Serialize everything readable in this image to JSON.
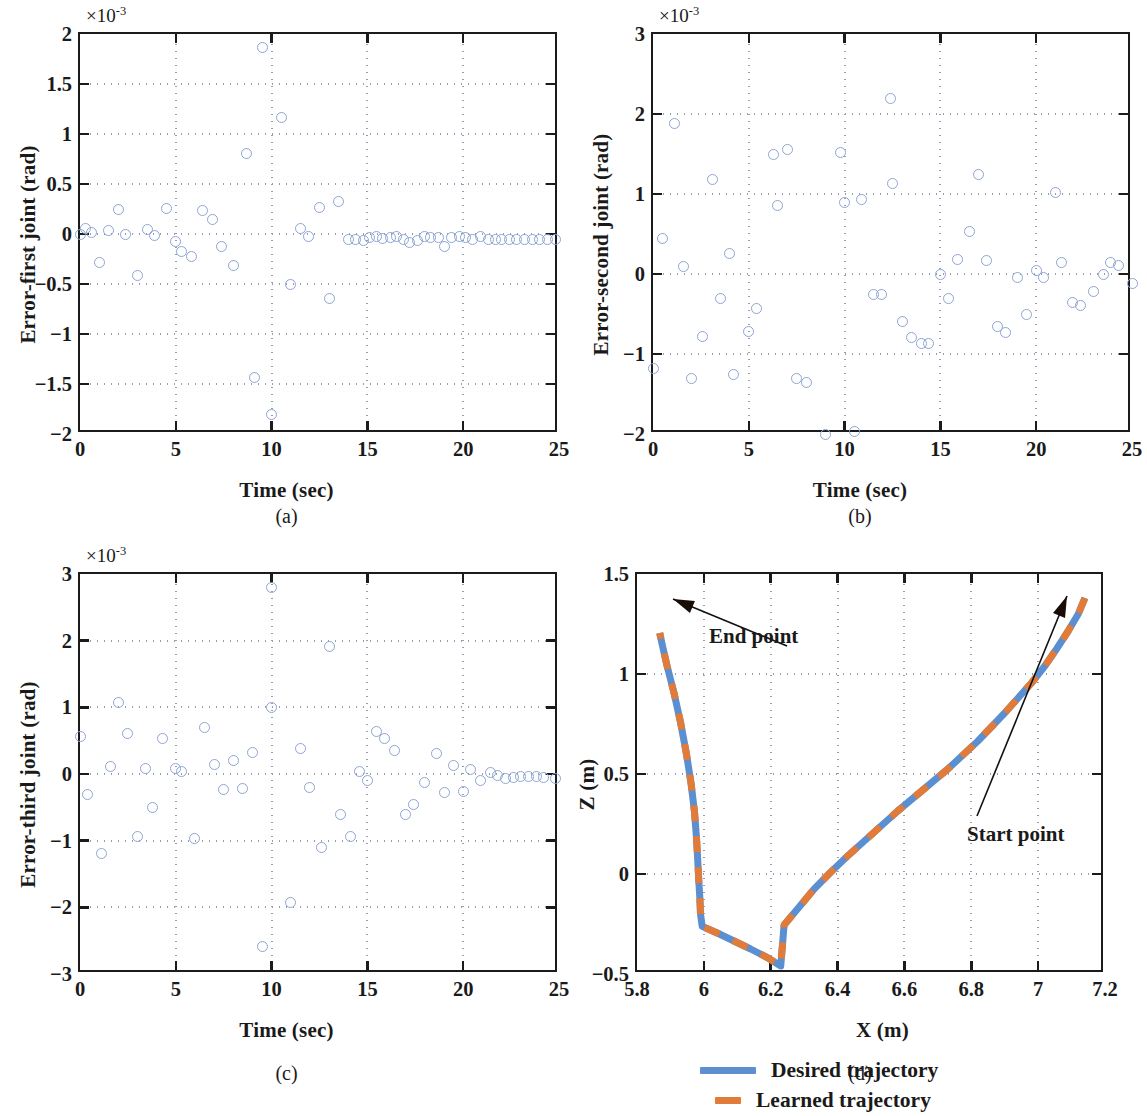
{
  "figure": {
    "panels": [
      {
        "id": "a",
        "caption": "(a)"
      },
      {
        "id": "b",
        "caption": "(b)"
      },
      {
        "id": "c",
        "caption": "(c)"
      },
      {
        "id": "d",
        "caption": "(d)"
      }
    ],
    "marker_color": "#8da5d4",
    "desired_color": "#5b8fd0",
    "learned_color": "#e07b39",
    "axis_color": "#1b1b1b",
    "grid_color": "#9a9ab0"
  },
  "legend": {
    "desired_label": "Desired trajectory",
    "learned_label": "Learned trajectory"
  },
  "chart_data": [
    {
      "type": "scatter",
      "panel": "a",
      "title": "",
      "xlabel": "Time (sec)",
      "ylabel": "Error-first joint (rad)",
      "y_exponent": "×10",
      "y_exponent_power": "-3",
      "xlim": [
        0,
        25
      ],
      "ylim": [
        -2,
        2
      ],
      "xticks": [
        0,
        5,
        10,
        15,
        20,
        25
      ],
      "xtick_labels": [
        "0",
        "5",
        "10",
        "15",
        "20",
        "25"
      ],
      "yticks": [
        -2,
        -1.5,
        -1,
        -0.5,
        0,
        0.5,
        1,
        1.5,
        2
      ],
      "ytick_labels": [
        "−2",
        "−1.5",
        "−1",
        "−0.5",
        "0",
        "0.5",
        "1",
        "1.5",
        "2"
      ],
      "grid": true,
      "legend_position": "none",
      "points": [
        [
          0.0,
          0.0
        ],
        [
          0.3,
          0.06
        ],
        [
          0.6,
          0.02
        ],
        [
          1.0,
          -0.28
        ],
        [
          1.5,
          0.04
        ],
        [
          2.0,
          0.25
        ],
        [
          2.4,
          0.0
        ],
        [
          3.0,
          -0.41
        ],
        [
          3.5,
          0.05
        ],
        [
          3.9,
          -0.01
        ],
        [
          4.5,
          0.26
        ],
        [
          5.0,
          -0.07
        ],
        [
          5.3,
          -0.17
        ],
        [
          5.8,
          -0.22
        ],
        [
          6.4,
          0.24
        ],
        [
          6.9,
          0.15
        ],
        [
          7.4,
          -0.12
        ],
        [
          8.0,
          -0.31
        ],
        [
          8.7,
          0.81
        ],
        [
          9.1,
          -1.43
        ],
        [
          9.5,
          1.87
        ],
        [
          10.0,
          -1.8
        ],
        [
          10.5,
          1.17
        ],
        [
          11.0,
          -0.5
        ],
        [
          11.5,
          0.06
        ],
        [
          11.9,
          -0.02
        ],
        [
          12.5,
          0.27
        ],
        [
          13.0,
          -0.64
        ],
        [
          13.5,
          0.33
        ],
        [
          14.0,
          -0.05
        ],
        [
          14.4,
          -0.05
        ],
        [
          14.8,
          -0.06
        ],
        [
          15.1,
          -0.03
        ],
        [
          15.5,
          -0.02
        ],
        [
          15.8,
          -0.04
        ],
        [
          16.2,
          -0.03
        ],
        [
          16.5,
          -0.02
        ],
        [
          16.9,
          -0.05
        ],
        [
          17.2,
          -0.08
        ],
        [
          17.6,
          -0.06
        ],
        [
          18.0,
          -0.02
        ],
        [
          18.3,
          -0.03
        ],
        [
          18.7,
          -0.03
        ],
        [
          19.0,
          -0.12
        ],
        [
          19.4,
          -0.03
        ],
        [
          19.8,
          -0.02
        ],
        [
          20.1,
          -0.03
        ],
        [
          20.5,
          -0.05
        ],
        [
          20.9,
          -0.02
        ],
        [
          21.3,
          -0.05
        ],
        [
          21.7,
          -0.05
        ],
        [
          22.0,
          -0.05
        ],
        [
          22.4,
          -0.05
        ],
        [
          22.8,
          -0.05
        ],
        [
          23.2,
          -0.05
        ],
        [
          23.6,
          -0.05
        ],
        [
          24.0,
          -0.05
        ],
        [
          24.4,
          -0.05
        ],
        [
          24.8,
          -0.05
        ]
      ]
    },
    {
      "type": "scatter",
      "panel": "b",
      "title": "",
      "xlabel": "Time (sec)",
      "ylabel": "Error-second joint (rad)",
      "y_exponent": "×10",
      "y_exponent_power": "-3",
      "xlim": [
        0,
        25
      ],
      "ylim": [
        -2,
        3
      ],
      "xticks": [
        0,
        5,
        10,
        15,
        20,
        25
      ],
      "xtick_labels": [
        "0",
        "5",
        "10",
        "15",
        "20",
        "25"
      ],
      "yticks": [
        -2,
        -1,
        0,
        1,
        2,
        3
      ],
      "ytick_labels": [
        "−2",
        "−1",
        "0",
        "1",
        "2",
        "3"
      ],
      "grid": true,
      "legend_position": "none",
      "points": [
        [
          0.0,
          -1.18
        ],
        [
          0.5,
          0.45
        ],
        [
          1.1,
          1.88
        ],
        [
          1.6,
          0.1
        ],
        [
          2.0,
          -1.3
        ],
        [
          2.6,
          -0.78
        ],
        [
          3.1,
          1.18
        ],
        [
          3.5,
          -0.31
        ],
        [
          4.0,
          0.26
        ],
        [
          4.2,
          -1.26
        ],
        [
          5.0,
          -0.72
        ],
        [
          5.4,
          -0.43
        ],
        [
          6.3,
          1.5
        ],
        [
          6.5,
          0.86
        ],
        [
          7.0,
          1.56
        ],
        [
          7.5,
          -1.31
        ],
        [
          8.0,
          -1.36
        ],
        [
          9.0,
          -2.0
        ],
        [
          9.8,
          1.52
        ],
        [
          10.0,
          0.9
        ],
        [
          10.5,
          -1.97
        ],
        [
          10.9,
          0.93
        ],
        [
          11.5,
          -0.25
        ],
        [
          11.9,
          -0.26
        ],
        [
          12.4,
          2.19
        ],
        [
          12.5,
          1.13
        ],
        [
          13.0,
          -0.59
        ],
        [
          13.5,
          -0.79
        ],
        [
          14.0,
          -0.87
        ],
        [
          14.4,
          -0.87
        ],
        [
          15.0,
          0.0
        ],
        [
          15.4,
          -0.3
        ],
        [
          15.9,
          0.18
        ],
        [
          16.5,
          0.53
        ],
        [
          17.0,
          1.25
        ],
        [
          17.4,
          0.17
        ],
        [
          18.0,
          -0.65
        ],
        [
          18.4,
          -0.73
        ],
        [
          19.0,
          -0.04
        ],
        [
          19.5,
          -0.51
        ],
        [
          20.0,
          0.05
        ],
        [
          20.4,
          -0.04
        ],
        [
          21.0,
          1.02
        ],
        [
          21.3,
          0.15
        ],
        [
          21.9,
          -0.35
        ],
        [
          22.3,
          -0.39
        ],
        [
          23.0,
          -0.22
        ],
        [
          23.5,
          0.0
        ],
        [
          23.9,
          0.15
        ],
        [
          24.3,
          0.11
        ],
        [
          25.0,
          -0.12
        ]
      ]
    },
    {
      "type": "scatter",
      "panel": "c",
      "title": "",
      "xlabel": "Time (sec)",
      "ylabel": "Error-third joint (rad)",
      "y_exponent": "×10",
      "y_exponent_power": "-3",
      "xlim": [
        0,
        25
      ],
      "ylim": [
        -3,
        3
      ],
      "xticks": [
        0,
        5,
        10,
        15,
        20,
        25
      ],
      "xtick_labels": [
        "0",
        "5",
        "10",
        "15",
        "20",
        "25"
      ],
      "yticks": [
        -3,
        -2,
        -1,
        0,
        1,
        2,
        3
      ],
      "ytick_labels": [
        "−3",
        "−2",
        "−1",
        "0",
        "1",
        "2",
        "3"
      ],
      "grid": true,
      "legend_position": "none",
      "points": [
        [
          0.0,
          0.56
        ],
        [
          0.4,
          -0.31
        ],
        [
          1.1,
          -1.19
        ],
        [
          1.6,
          0.11
        ],
        [
          2.0,
          1.07
        ],
        [
          2.5,
          0.61
        ],
        [
          3.0,
          -0.94
        ],
        [
          3.4,
          0.08
        ],
        [
          3.8,
          -0.5
        ],
        [
          4.3,
          0.54
        ],
        [
          5.0,
          0.08
        ],
        [
          5.3,
          0.04
        ],
        [
          6.0,
          -0.96
        ],
        [
          6.5,
          0.7
        ],
        [
          7.0,
          0.15
        ],
        [
          7.5,
          -0.23
        ],
        [
          8.0,
          0.2
        ],
        [
          8.5,
          -0.22
        ],
        [
          9.0,
          0.32
        ],
        [
          9.5,
          -2.58
        ],
        [
          10.0,
          1.0
        ],
        [
          10.0,
          2.8
        ],
        [
          11.0,
          -1.93
        ],
        [
          11.5,
          0.38
        ],
        [
          12.0,
          -0.2
        ],
        [
          12.6,
          -1.1
        ],
        [
          13.0,
          1.92
        ],
        [
          13.6,
          -0.6
        ],
        [
          14.1,
          -0.93
        ],
        [
          14.6,
          0.04
        ],
        [
          15.0,
          -0.09
        ],
        [
          15.5,
          0.64
        ],
        [
          15.9,
          0.54
        ],
        [
          16.4,
          0.36
        ],
        [
          17.0,
          -0.6
        ],
        [
          17.4,
          -0.45
        ],
        [
          18.0,
          -0.13
        ],
        [
          18.6,
          0.31
        ],
        [
          19.0,
          -0.27
        ],
        [
          19.5,
          0.13
        ],
        [
          20.0,
          -0.26
        ],
        [
          20.4,
          0.07
        ],
        [
          20.9,
          -0.09
        ],
        [
          21.4,
          0.02
        ],
        [
          21.8,
          -0.02
        ],
        [
          22.2,
          -0.06
        ],
        [
          22.6,
          -0.05
        ],
        [
          23.0,
          -0.04
        ],
        [
          23.4,
          -0.03
        ],
        [
          23.8,
          -0.04
        ],
        [
          24.2,
          -0.05
        ],
        [
          24.8,
          -0.07
        ]
      ]
    },
    {
      "type": "line",
      "panel": "d",
      "title": "",
      "xlabel": "X (m)",
      "ylabel": "Z (m)",
      "xlim": [
        5.8,
        7.2
      ],
      "ylim": [
        -0.5,
        1.5
      ],
      "xticks": [
        5.8,
        6,
        6.2,
        6.4,
        6.6,
        6.8,
        7,
        7.2
      ],
      "xtick_labels": [
        "5.8",
        "6",
        "6.2",
        "6.4",
        "6.6",
        "6.8",
        "7",
        "7.2"
      ],
      "yticks": [
        -0.5,
        0,
        0.5,
        1,
        1.5
      ],
      "ytick_labels": [
        "−0.5",
        "0",
        "0.5",
        "1",
        "1.5"
      ],
      "grid": true,
      "legend_position": "below",
      "annotations": [
        {
          "text": "End point",
          "x": 5.87,
          "y": 1.21
        },
        {
          "text": "Start point",
          "x": 7.14,
          "y": 1.38
        }
      ],
      "series": [
        {
          "name": "Desired trajectory",
          "style": "solid",
          "color": "#5b8fd0",
          "x": [
            7.14,
            7.12,
            7.09,
            7.055,
            7.02,
            6.98,
            6.94,
            6.9,
            6.86,
            6.82,
            6.775,
            6.73,
            6.68,
            6.63,
            6.58,
            6.53,
            6.48,
            6.43,
            6.38,
            6.33,
            6.285,
            6.24,
            6.23,
            6.19,
            6.14,
            6.09,
            6.04,
            5.995,
            5.99,
            5.988,
            5.985,
            5.982,
            5.978,
            5.972,
            5.962,
            5.948,
            5.93,
            5.91,
            5.89,
            5.875,
            5.868
          ],
          "y": [
            1.38,
            1.3,
            1.215,
            1.125,
            1.04,
            0.955,
            0.88,
            0.805,
            0.735,
            0.665,
            0.595,
            0.525,
            0.455,
            0.385,
            0.315,
            0.24,
            0.165,
            0.09,
            0.01,
            -0.075,
            -0.165,
            -0.255,
            -0.46,
            -0.418,
            -0.375,
            -0.335,
            -0.295,
            -0.262,
            -0.2,
            -0.12,
            -0.04,
            0.06,
            0.18,
            0.31,
            0.45,
            0.6,
            0.76,
            0.91,
            1.04,
            1.15,
            1.205
          ]
        },
        {
          "name": "Learned trajectory",
          "style": "dashed",
          "color": "#e07b39",
          "x": [
            7.14,
            7.12,
            7.09,
            7.055,
            7.02,
            6.98,
            6.94,
            6.9,
            6.86,
            6.82,
            6.775,
            6.73,
            6.68,
            6.63,
            6.58,
            6.53,
            6.48,
            6.43,
            6.38,
            6.33,
            6.285,
            6.24,
            6.23,
            6.19,
            6.14,
            6.09,
            6.04,
            5.995,
            5.99,
            5.988,
            5.985,
            5.982,
            5.978,
            5.972,
            5.962,
            5.948,
            5.93,
            5.91,
            5.89,
            5.875,
            5.868
          ],
          "y": [
            1.38,
            1.3,
            1.215,
            1.125,
            1.04,
            0.955,
            0.88,
            0.805,
            0.735,
            0.665,
            0.595,
            0.525,
            0.455,
            0.385,
            0.315,
            0.24,
            0.165,
            0.09,
            0.01,
            -0.075,
            -0.165,
            -0.255,
            -0.46,
            -0.418,
            -0.375,
            -0.335,
            -0.295,
            -0.262,
            -0.2,
            -0.12,
            -0.04,
            0.06,
            0.18,
            0.31,
            0.45,
            0.6,
            0.76,
            0.91,
            1.04,
            1.15,
            1.205
          ]
        }
      ]
    }
  ]
}
